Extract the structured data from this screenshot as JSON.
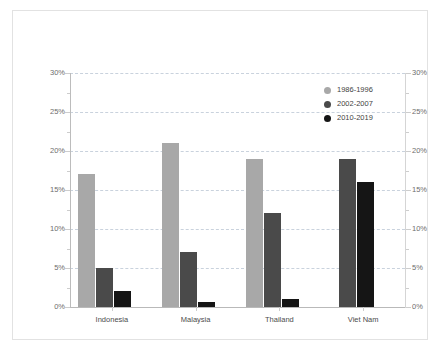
{
  "chart_data": {
    "type": "bar",
    "title": "",
    "subtitle": "",
    "xlabel": "",
    "ylabel": "",
    "ylim": [
      0,
      30
    ],
    "ytick_values": [
      0,
      5,
      10,
      15,
      20,
      25,
      30
    ],
    "ytick_labels": [
      "0%",
      "5%",
      "10%",
      "15%",
      "20%",
      "25%",
      "30%"
    ],
    "y_axis_right": {
      "enabled": true,
      "ylim": [
        0,
        30
      ],
      "ytick_labels": [
        "0%",
        "5%",
        "10%",
        "15%",
        "20%",
        "25%",
        "30%"
      ]
    },
    "grid": true,
    "grid_style": "dashed",
    "legend_position": "upper right (inside plot)",
    "categories": [
      "Indonesia",
      "Malaysia",
      "Thailand",
      "Viet Nam"
    ],
    "series": [
      {
        "name": "1986-1996",
        "color": "#a8a8a8",
        "values": [
          17,
          21,
          19,
          null
        ]
      },
      {
        "name": "2002-2007",
        "color": "#4a4a4a",
        "values": [
          5,
          7,
          12,
          19
        ]
      },
      {
        "name": "2010-2019",
        "color": "#151515",
        "values": [
          2,
          0.7,
          1,
          16
        ]
      }
    ]
  },
  "legend": {
    "items": [
      {
        "label": "1986-1996",
        "swatch": "circle-marker-light-gray"
      },
      {
        "label": "2002-2007",
        "swatch": "circle-marker-dark-gray"
      },
      {
        "label": "2010-2019",
        "swatch": "circle-marker-black"
      }
    ]
  },
  "colors": {
    "series_1986_1996": "#a8a8a8",
    "series_2002_2007": "#4a4a4a",
    "series_2010_2019": "#151515",
    "gridline": "#c9d2dd",
    "axis": "#bcbcbc",
    "frame_border": "#e2e2e2",
    "tick_text": "#6d6d6d",
    "category_text": "#4c4c4c",
    "background": "#ffffff"
  }
}
